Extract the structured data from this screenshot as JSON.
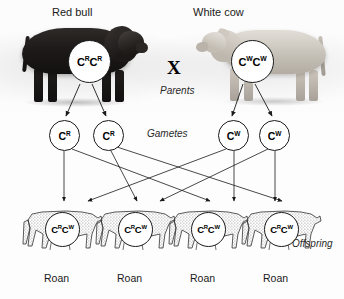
{
  "diagram": {
    "title_left": "Red bull",
    "title_right": "White cow",
    "cross_symbol": "X",
    "stage_labels": {
      "parents": "Parents",
      "gametes": "Gametes",
      "offspring": "Offspring"
    }
  },
  "parents": [
    {
      "name": "Red bull",
      "genotype_base": "C",
      "allele_1": "R",
      "allele_2": "R",
      "coat": "red",
      "coat_hex": "#1d1a19"
    },
    {
      "name": "White cow",
      "genotype_base": "C",
      "allele_1": "W",
      "allele_2": "W",
      "coat": "white",
      "coat_hex": "#c9c4bb"
    }
  ],
  "gametes": [
    {
      "parent": "Red bull",
      "base": "C",
      "allele": "R"
    },
    {
      "parent": "Red bull",
      "base": "C",
      "allele": "R"
    },
    {
      "parent": "White cow",
      "base": "C",
      "allele": "W"
    },
    {
      "parent": "White cow",
      "base": "C",
      "allele": "W"
    }
  ],
  "offspring": [
    {
      "base": "C",
      "allele_1": "R",
      "allele_2": "W",
      "phenotype": "Roan"
    },
    {
      "base": "C",
      "allele_1": "R",
      "allele_2": "W",
      "phenotype": "Roan"
    },
    {
      "base": "C",
      "allele_1": "R",
      "allele_2": "W",
      "phenotype": "Roan"
    },
    {
      "base": "C",
      "allele_1": "R",
      "allele_2": "W",
      "phenotype": "Roan"
    }
  ],
  "colors": {
    "ink": "#1a1a1a",
    "page_background": "#fdfdfd",
    "bubble_fill": "#ffffff",
    "calf_stipple": "#7a7a7a"
  }
}
